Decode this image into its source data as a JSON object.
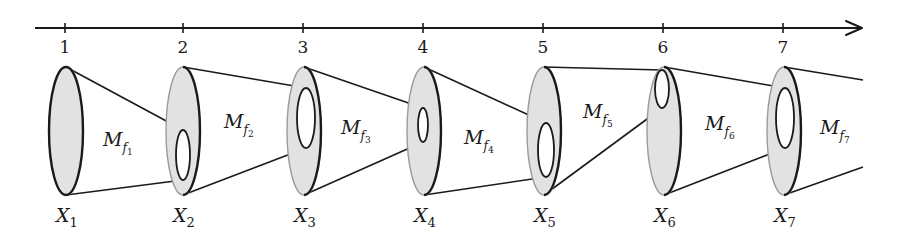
{
  "figure": {
    "colors": {
      "stroke": "#1a1a1a",
      "fill": "#e2e2e2",
      "back_edge": "#9a9a9a",
      "inner_fill": "#ffffff"
    }
  },
  "axis": {
    "start_x": 35,
    "end_x": 862,
    "y": 28,
    "ticks": [
      {
        "label": "1",
        "x": 65
      },
      {
        "label": "2",
        "x": 183
      },
      {
        "label": "3",
        "x": 303
      },
      {
        "label": "4",
        "x": 423
      },
      {
        "label": "5",
        "x": 543
      },
      {
        "label": "6",
        "x": 663
      },
      {
        "label": "7",
        "x": 783
      }
    ]
  },
  "sets": [
    {
      "label": "X",
      "subscript": "1",
      "cx": 66,
      "cy": 131,
      "rx": 17,
      "ry": 64,
      "inner": null
    },
    {
      "label": "X",
      "subscript": "2",
      "cx": 183,
      "cy": 131,
      "rx": 17,
      "ry": 64,
      "inner": {
        "cx": 183,
        "cy": 155,
        "rx": 7,
        "ry": 25
      }
    },
    {
      "label": "X",
      "subscript": "3",
      "cx": 304,
      "cy": 131,
      "rx": 17,
      "ry": 64,
      "inner": {
        "cx": 306,
        "cy": 118,
        "rx": 9,
        "ry": 30
      }
    },
    {
      "label": "X",
      "subscript": "4",
      "cx": 424,
      "cy": 131,
      "rx": 17,
      "ry": 64,
      "inner": {
        "cx": 423,
        "cy": 125,
        "rx": 5,
        "ry": 17
      }
    },
    {
      "label": "X",
      "subscript": "5",
      "cx": 544,
      "cy": 131,
      "rx": 17,
      "ry": 64,
      "inner": {
        "cx": 546,
        "cy": 150,
        "rx": 8,
        "ry": 27
      }
    },
    {
      "label": "X",
      "subscript": "6",
      "cx": 664,
      "cy": 131,
      "rx": 17,
      "ry": 64,
      "inner": {
        "cx": 662,
        "cy": 89,
        "rx": 7,
        "ry": 19
      }
    },
    {
      "label": "X",
      "subscript": "7",
      "cx": 784,
      "cy": 131,
      "rx": 17,
      "ry": 64,
      "inner": {
        "cx": 785,
        "cy": 118,
        "rx": 9,
        "ry": 30
      }
    }
  ],
  "maps": [
    {
      "label": "M",
      "subscript": "f",
      "index": "1",
      "x": 103,
      "y": 146
    },
    {
      "label": "M",
      "subscript": "f",
      "index": "2",
      "x": 224,
      "y": 128
    },
    {
      "label": "M",
      "subscript": "f",
      "index": "3",
      "x": 341,
      "y": 134
    },
    {
      "label": "M",
      "subscript": "f",
      "index": "4",
      "x": 464,
      "y": 144
    },
    {
      "label": "M",
      "subscript": "f",
      "index": "5",
      "x": 583,
      "y": 118
    },
    {
      "label": "M",
      "subscript": "f",
      "index": "6",
      "x": 705,
      "y": 130
    },
    {
      "label": "M",
      "subscript": "f",
      "index": "7",
      "x": 820,
      "y": 134
    }
  ],
  "open_end": {
    "x": 863,
    "top_y": 80,
    "bottom_y": 167
  }
}
